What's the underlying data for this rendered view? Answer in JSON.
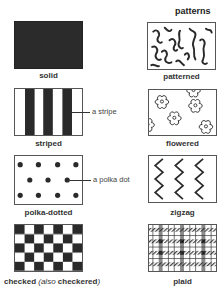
{
  "title": "patterns",
  "items": [
    {
      "key": "solid",
      "label": "solid"
    },
    {
      "key": "patterned",
      "label": "patterned"
    },
    {
      "key": "striped",
      "label": "striped"
    },
    {
      "key": "flowered",
      "label": "flowered"
    },
    {
      "key": "polka-dotted",
      "label": "polka-dotted"
    },
    {
      "key": "zigzag",
      "label": "zigzag"
    },
    {
      "key": "checked",
      "label": "checked",
      "label_paren_open": " (",
      "label_also": "also",
      "label_alt": " checkered",
      "label_paren_close": ")"
    },
    {
      "key": "plaid",
      "label": "plaid"
    }
  ],
  "callouts": {
    "stripe": "a stripe",
    "polka_dot": "a polka dot"
  },
  "colors": {
    "solid_fill": "#2b2b2b",
    "ink": "#2a2a2a",
    "border": "#555555"
  }
}
